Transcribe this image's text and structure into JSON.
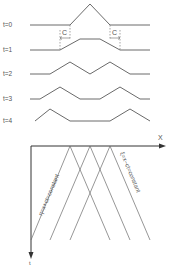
{
  "time_labels": [
    "t=0",
    "t=1",
    "t=2",
    "t=3",
    "t=4"
  ],
  "speed_label": "C",
  "axes": {
    "x_label": "X",
    "t_label": "t"
  },
  "characteristics": {
    "left": "η=x+ct=constant",
    "right": "ξ=x−ct=constant"
  },
  "colors": {
    "line": "#6a6a6a",
    "text": "#555555",
    "axis": "#333333"
  }
}
